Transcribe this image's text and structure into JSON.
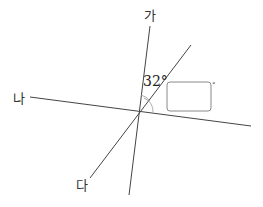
{
  "diagram": {
    "lines": [
      {
        "name": "가",
        "label": "가",
        "x1": 150,
        "y1": 26,
        "x2": 129,
        "y2": 195
      },
      {
        "name": "나",
        "label": "나",
        "x1": 30,
        "y1": 97,
        "x2": 251,
        "y2": 126
      },
      {
        "name": "다",
        "label": "다",
        "x1": 191,
        "y1": 45,
        "x2": 90,
        "y2": 178
      }
    ],
    "labels": {
      "ga": "가",
      "na": "나",
      "da": "다"
    },
    "angle_label": "32°",
    "answer_box_unit": "°",
    "colors": {
      "line": "#444444",
      "box_border": "#888888"
    }
  }
}
